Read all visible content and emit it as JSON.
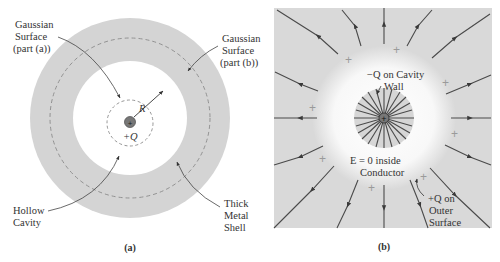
{
  "panel_a": {
    "caption": "(a)",
    "labels": {
      "gaussian_a": [
        "Gaussian",
        "Surface",
        "(part (a))"
      ],
      "gaussian_b": [
        "Gaussian",
        "Surface",
        "(part (b))"
      ],
      "hollow_cavity": [
        "Hollow",
        "Cavity"
      ],
      "thick_shell": [
        "Thick",
        "Metal",
        "Shell"
      ],
      "radius": "R",
      "charge": "+Q",
      "charge_symbol": "+"
    }
  },
  "panel_b": {
    "caption": "(b)",
    "labels": {
      "cavity_wall": [
        "−Q on Cavity",
        "Wall"
      ],
      "e_zero": [
        "E = 0 inside",
        "Conductor"
      ],
      "outer_surface": [
        "+Q on",
        "Outer",
        "Surface"
      ],
      "surface_plus": "+",
      "charge_symbol": "+"
    }
  },
  "colors": {
    "shell_gray": "#d4d4d4",
    "panel_b_bg": "#d9d9d9",
    "field_line": "#4a4a4a",
    "text": "#333333",
    "dashed": "#8a8a8a"
  }
}
